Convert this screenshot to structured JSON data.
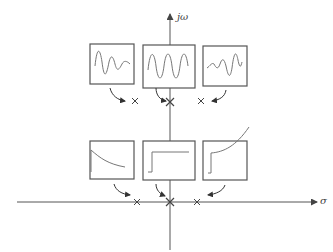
{
  "axes": {
    "vertical_label": "jω",
    "horizontal_label": "σ",
    "color": "#555555"
  },
  "stroke_color": "#666666",
  "upper_row": {
    "description": "Complex-conjugate pole locations and oscillatory impulse responses",
    "boxes": [
      {
        "id": "left",
        "response": "decaying oscillation",
        "pole": "left half-plane on upper row"
      },
      {
        "id": "center",
        "response": "sustained oscillation",
        "pole": "on jω axis"
      },
      {
        "id": "right",
        "response": "growing oscillation",
        "pole": "right half-plane on upper row"
      }
    ]
  },
  "lower_row": {
    "description": "Real-axis pole locations and non-oscillatory responses",
    "boxes": [
      {
        "id": "left",
        "response": "decaying exponential",
        "pole": "negative real axis"
      },
      {
        "id": "center",
        "response": "step (constant)",
        "pole": "origin"
      },
      {
        "id": "right",
        "response": "growing exponential",
        "pole": "positive real axis"
      }
    ]
  }
}
